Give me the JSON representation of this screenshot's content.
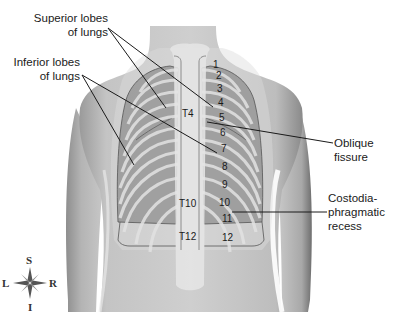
{
  "figure": {
    "view": "Posterior view of the thorax showing lungs and ribs",
    "labels": {
      "superior_lobes": [
        "Superior lobes",
        "of lungs"
      ],
      "inferior_lobes": [
        "Inferior lobes",
        "of lungs"
      ],
      "oblique_fissure": [
        "Oblique",
        "fissure"
      ],
      "costodiaphragmatic_recess": [
        "Costodia-",
        "phragmatic",
        "recess"
      ]
    },
    "rib_numbers": [
      "1",
      "2",
      "3",
      "4",
      "5",
      "6",
      "7",
      "8",
      "9",
      "10",
      "11",
      "12"
    ],
    "vertebra_labels": {
      "t4": "T4",
      "t10": "T10",
      "t12": "T12"
    },
    "compass": {
      "top": "S",
      "bottom": "I",
      "left": "L",
      "right": "R"
    }
  }
}
